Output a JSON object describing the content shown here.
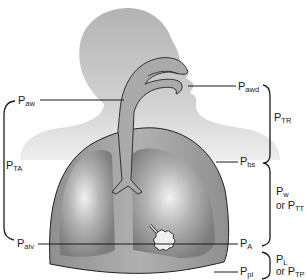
{
  "diagram": {
    "colors": {
      "head": "#b8b8b8",
      "airway": "#a9a9a9",
      "thorax": "#9a9a9a",
      "lung": "#8a8a8a",
      "lines": "#1a1a1a"
    },
    "labels": {
      "p_aw": {
        "main": "P",
        "sub": "aw"
      },
      "p_ta": {
        "main": "P",
        "sub": "TA"
      },
      "p_alv": {
        "main": "P",
        "sub": "alv"
      },
      "p_awd": {
        "main": "P",
        "sub": "awd"
      },
      "p_tr": {
        "main": "P",
        "sub": "TR"
      },
      "p_bs": {
        "main": "P",
        "sub": "bs"
      },
      "p_w": {
        "main": "P",
        "sub": "w"
      },
      "p_tt": {
        "or": "or ",
        "main": "P",
        "sub": "TT"
      },
      "p_a": {
        "main": "P",
        "sub": "A"
      },
      "p_l": {
        "main": "P",
        "sub": "L"
      },
      "p_tp": {
        "or": "or ",
        "main": "P",
        "sub": "TP"
      },
      "p_pl": {
        "main": "P",
        "sub": "pl"
      }
    }
  }
}
